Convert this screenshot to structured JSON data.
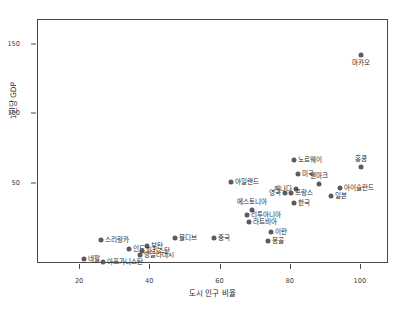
{
  "chart_data": {
    "type": "scatter",
    "title": "",
    "xlabel": "도시 인구 비율",
    "ylabel": "1인당 GDP",
    "xlim": [
      8,
      108
    ],
    "ylim": [
      -8,
      168
    ],
    "xticks": [
      20,
      40,
      60,
      80,
      100
    ],
    "yticks": [
      50,
      100,
      150
    ],
    "grid": false,
    "legend": null,
    "marker_color": "#5b5b5b",
    "points": [
      {
        "label": "마카오",
        "x": 100.0,
        "y": 143.0,
        "pos": "below"
      },
      {
        "label": "홍콩",
        "x": 100.0,
        "y": 62.0,
        "pos": "above"
      },
      {
        "label": "노르웨이",
        "x": 81.0,
        "y": 67.0,
        "pos": "right"
      },
      {
        "label": "미국",
        "x": 82.0,
        "y": 57.0,
        "pos": "right"
      },
      {
        "label": "아이슬란드",
        "x": 94.0,
        "y": 47.0,
        "pos": "right"
      },
      {
        "label": "아일랜드",
        "x": 63.0,
        "y": 51.0,
        "pos": "right"
      },
      {
        "label": "덴마크",
        "x": 88.0,
        "y": 50.0,
        "pos": "above"
      },
      {
        "label": "캐나다",
        "x": 81.5,
        "y": 46.0,
        "pos": "left"
      },
      {
        "label": "프랑스",
        "x": 80.0,
        "y": 43.0,
        "pos": "right"
      },
      {
        "label": "영국",
        "x": 78.5,
        "y": 43.0,
        "pos": "left"
      },
      {
        "label": "일본",
        "x": 91.5,
        "y": 41.0,
        "pos": "right"
      },
      {
        "label": "한국",
        "x": 81.0,
        "y": 36.0,
        "pos": "right"
      },
      {
        "label": "에스토니아",
        "x": 69.0,
        "y": 31.0,
        "pos": "above"
      },
      {
        "label": "리투아니아",
        "x": 67.5,
        "y": 27.0,
        "pos": "right"
      },
      {
        "label": "라트비아",
        "x": 68.0,
        "y": 22.0,
        "pos": "right"
      },
      {
        "label": "이란",
        "x": 74.5,
        "y": 15.0,
        "pos": "right"
      },
      {
        "label": "중국",
        "x": 58.0,
        "y": 11.0,
        "pos": "right"
      },
      {
        "label": "몰디브",
        "x": 47.0,
        "y": 11.0,
        "pos": "right"
      },
      {
        "label": "몽골",
        "x": 73.5,
        "y": 8.5,
        "pos": "right"
      },
      {
        "label": "스리랑카",
        "x": 26.0,
        "y": 9.5,
        "pos": "right"
      },
      {
        "label": "부탄",
        "x": 39.0,
        "y": 5.0,
        "pos": "right"
      },
      {
        "label": "인도",
        "x": 34.0,
        "y": 3.0,
        "pos": "right"
      },
      {
        "label": "파키스탄",
        "x": 37.5,
        "y": 1.5,
        "pos": "right"
      },
      {
        "label": "방글라데시",
        "x": 37.0,
        "y": -1.5,
        "pos": "right"
      },
      {
        "label": "네팔",
        "x": 21.0,
        "y": -4.5,
        "pos": "right"
      },
      {
        "label": "아프가니스탄",
        "x": 26.5,
        "y": -6.5,
        "pos": "right"
      }
    ]
  }
}
